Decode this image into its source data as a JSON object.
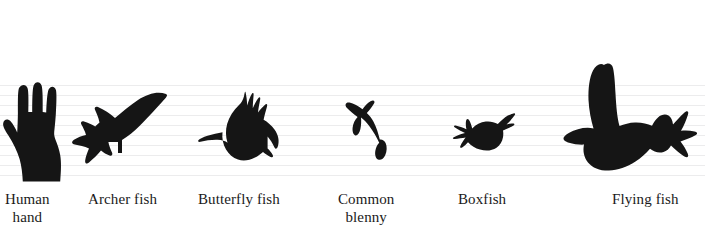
{
  "figure": {
    "background_color": "#ffffff",
    "silhouette_color": "#151515",
    "gridline_color": "#ececed",
    "width": 705,
    "height": 239
  },
  "gridlines": {
    "count": 10,
    "first_y": 85,
    "spacing": 10,
    "orientation": "horizontal",
    "visible": true
  },
  "specimens": [
    {
      "id": "human-hand",
      "label": "Human\nhand",
      "label_line1": "Human",
      "label_line2": "hand",
      "icon": "human-hand-silhouette",
      "label_x": 5,
      "label_y": 190,
      "shape_x": 2,
      "shape_y": 80,
      "shape_w": 62,
      "shape_h": 102
    },
    {
      "id": "archer-fish",
      "label": "Archer fish",
      "label_line1": "Archer fish",
      "label_line2": "",
      "icon": "archer-fish-silhouette",
      "label_x": 88,
      "label_y": 190,
      "shape_x": 70,
      "shape_y": 88,
      "shape_w": 98,
      "shape_h": 80
    },
    {
      "id": "butterfly-fish",
      "label": "Butterfly fish",
      "label_line1": "Butterfly fish",
      "label_line2": "",
      "icon": "butterfly-fish-silhouette",
      "label_x": 198,
      "label_y": 190,
      "shape_x": 198,
      "shape_y": 90,
      "shape_w": 86,
      "shape_h": 80
    },
    {
      "id": "common-blenny",
      "label": "Common\nblenny",
      "label_line1": "Common",
      "label_line2": "blenny",
      "icon": "common-blenny-silhouette",
      "label_x": 338,
      "label_y": 190,
      "shape_x": 340,
      "shape_y": 98,
      "shape_w": 56,
      "shape_h": 68
    },
    {
      "id": "boxfish",
      "label": "Boxfish",
      "label_line1": "Boxfish",
      "label_line2": "",
      "icon": "boxfish-silhouette",
      "label_x": 458,
      "label_y": 190,
      "shape_x": 447,
      "shape_y": 112,
      "shape_w": 70,
      "shape_h": 44
    },
    {
      "id": "flying-fish",
      "label": "Flying fish",
      "label_line1": "Flying fish",
      "label_line2": "",
      "icon": "flying-fish-silhouette",
      "label_x": 612,
      "label_y": 190,
      "shape_x": 558,
      "shape_y": 62,
      "shape_w": 145,
      "shape_h": 110
    }
  ]
}
